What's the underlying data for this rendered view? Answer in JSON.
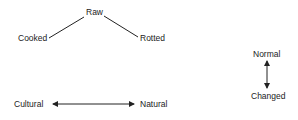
{
  "triangle": {
    "top": "Raw",
    "left": "Cooked",
    "right": "Rotted"
  },
  "vertical_axis": {
    "top": "Normal",
    "bottom": "Changed"
  },
  "horizontal_axis": {
    "left": "Cultural",
    "right": "Natural"
  },
  "colors": {
    "ink": "#222222",
    "background": "#ffffff"
  }
}
